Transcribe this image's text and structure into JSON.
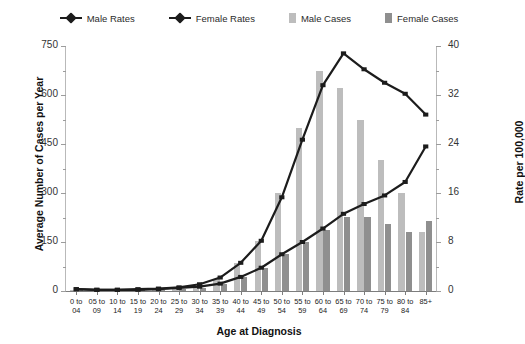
{
  "chart_data": {
    "type": "bar",
    "title": "",
    "xlabel": "Age at Diagnosis",
    "ylabel": "Average Number of Cases per Year",
    "y2label": "Rate per 100,000",
    "ylim": [
      0,
      750
    ],
    "y2lim": [
      0,
      40
    ],
    "yticks": [
      0,
      150,
      300,
      450,
      600,
      750
    ],
    "y2ticks": [
      0,
      8,
      16,
      24,
      32,
      40
    ],
    "grid": false,
    "legend_position": "top",
    "categories": [
      "0 to\n04",
      "05 to\n09",
      "10 to\n14",
      "15 to\n19",
      "20 to\n24",
      "25 to\n29",
      "30 to\n34",
      "35 to\n39",
      "40 to\n44",
      "45 to\n49",
      "50 to\n54",
      "55 to\n59",
      "60 to\n64",
      "65 to\n69",
      "70 to\n74",
      "75 to\n79",
      "80 to\n84",
      "85+"
    ],
    "series": [
      {
        "name": "Male Cases",
        "type": "bar",
        "axis": "left",
        "color": "#bdbdbd",
        "values": [
          3,
          2,
          2,
          3,
          5,
          8,
          16,
          36,
          86,
          152,
          300,
          500,
          672,
          620,
          525,
          400,
          300,
          180
        ]
      },
      {
        "name": "Female Cases",
        "type": "bar",
        "axis": "left",
        "color": "#8f8f8f",
        "values": [
          3,
          2,
          2,
          3,
          4,
          6,
          10,
          20,
          42,
          70,
          112,
          150,
          188,
          228,
          228,
          206,
          182,
          215
        ]
      },
      {
        "name": "Male Rates",
        "type": "line",
        "axis": "right",
        "color": "#1c1c1c",
        "values": [
          0.3,
          0.2,
          0.2,
          0.3,
          0.4,
          0.6,
          1.1,
          2.2,
          4.6,
          8.2,
          15.3,
          24.7,
          33.6,
          38.8,
          36.2,
          34.0,
          32.2,
          28.8
        ]
      },
      {
        "name": "Female Rates",
        "type": "line",
        "axis": "right",
        "color": "#1c1c1c",
        "values": [
          0.3,
          0.2,
          0.2,
          0.2,
          0.3,
          0.5,
          0.7,
          1.2,
          2.3,
          3.8,
          6.0,
          8.0,
          10.2,
          12.6,
          14.2,
          15.6,
          17.8,
          23.6
        ]
      }
    ]
  },
  "legend": {
    "items": [
      {
        "label": "Male Rates",
        "marker": "line-marker",
        "color": "#1c1c1c"
      },
      {
        "label": "Female Rates",
        "marker": "line-marker",
        "color": "#1c1c1c"
      },
      {
        "label": "Male Cases",
        "marker": "bar-swatch",
        "color": "#bdbdbd"
      },
      {
        "label": "Female Cases",
        "marker": "bar-swatch",
        "color": "#8f8f8f"
      }
    ]
  },
  "axes": {
    "left_title": "Average Number of Cases per Year",
    "right_title": "Rate per 100,000",
    "x_title": "Age at Diagnosis",
    "left_ticks": [
      "0",
      "150",
      "300",
      "450",
      "600",
      "750"
    ],
    "right_ticks": [
      "0",
      "8",
      "16",
      "24",
      "32",
      "40"
    ]
  }
}
